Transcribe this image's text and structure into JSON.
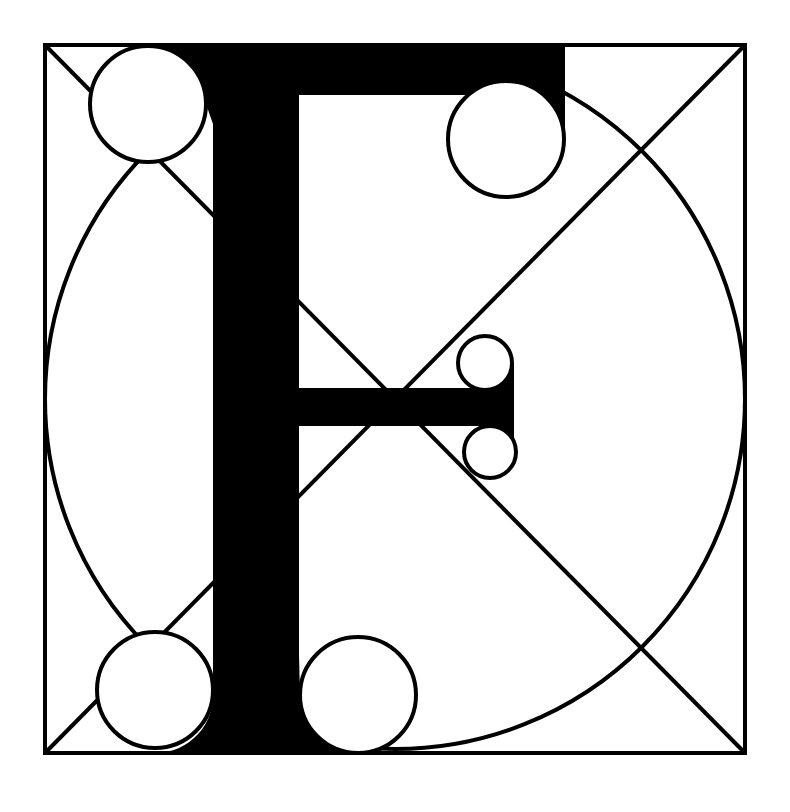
{
  "diagram": {
    "ink_color": "#000000",
    "paper_color": "#ffffff",
    "frame": {
      "x": 45,
      "y": 45,
      "width": 700,
      "height": 708
    },
    "diagonals": [
      {
        "x1": 45,
        "y1": 45,
        "x2": 745,
        "y2": 753
      },
      {
        "x1": 745,
        "y1": 45,
        "x2": 45,
        "y2": 753
      }
    ],
    "construction_circle": {
      "cx": 395,
      "cy": 399,
      "r": 350
    },
    "letter": {
      "glyph": "F",
      "stem": {
        "x": 213,
        "y": 45,
        "width": 86,
        "height": 708
      },
      "top_bar": {
        "x": 190,
        "y": 45,
        "width": 375,
        "height": 50
      },
      "middle_bar": {
        "x": 299,
        "y": 388,
        "width": 215,
        "height": 38
      }
    },
    "serif_circles": [
      {
        "name": "top-left",
        "cx": 148,
        "cy": 104,
        "r": 58
      },
      {
        "name": "top-right",
        "cx": 506,
        "cy": 139,
        "r": 58
      },
      {
        "name": "bar-upper",
        "cx": 485,
        "cy": 363,
        "r": 27
      },
      {
        "name": "bar-lower",
        "cx": 490,
        "cy": 452,
        "r": 26
      },
      {
        "name": "bottom-left",
        "cx": 155,
        "cy": 690,
        "r": 58
      },
      {
        "name": "bottom-right",
        "cx": 358,
        "cy": 695,
        "r": 58
      }
    ]
  }
}
